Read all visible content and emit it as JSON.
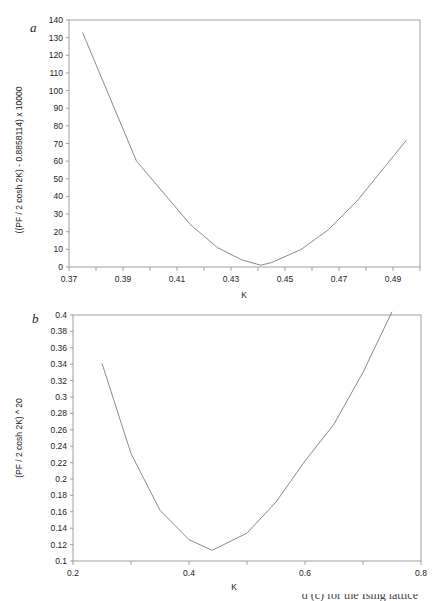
{
  "chart_data": [
    {
      "panel": "a",
      "type": "line",
      "title": "",
      "xlabel": "K",
      "ylabel": "((PF / 2 cosh 2K) - 0.8858114) x 10000",
      "xlim": [
        0.37,
        0.5
      ],
      "ylim": [
        0,
        140
      ],
      "xticks": [
        "0.37",
        "0.39",
        "0.41",
        "0.43",
        "0.45",
        "0.47",
        "0.49"
      ],
      "yticks": [
        "0",
        "10",
        "20",
        "30",
        "40",
        "50",
        "60",
        "70",
        "80",
        "90",
        "100",
        "110",
        "120",
        "130",
        "140"
      ],
      "grid": false,
      "legend": null,
      "x": [
        0.375,
        0.395,
        0.415,
        0.425,
        0.434,
        0.441,
        0.445,
        0.456,
        0.466,
        0.477,
        0.495
      ],
      "y": [
        133,
        60,
        24,
        11,
        4,
        1,
        2.5,
        10,
        21,
        38,
        72
      ]
    },
    {
      "panel": "b",
      "type": "line",
      "title": "",
      "xlabel": "K",
      "ylabel": "(PF / 2 cosh 2K) ^ 20",
      "xlim": [
        0.2,
        0.8
      ],
      "ylim": [
        0.1,
        0.4
      ],
      "xticks": [
        "0.2",
        "0.4",
        "0.6",
        "0.8"
      ],
      "yticks": [
        "0.1",
        "0.12",
        "0.14",
        "0.16",
        "0.18",
        "0.2",
        "0.22",
        "0.24",
        "0.26",
        "0.28",
        "0.3",
        "0.32",
        "0.34",
        "0.36",
        "0.38",
        "0.4"
      ],
      "grid": false,
      "legend": null,
      "x": [
        0.25,
        0.3,
        0.35,
        0.4,
        0.44,
        0.5,
        0.55,
        0.6,
        0.65,
        0.7,
        0.75
      ],
      "y": [
        0.341,
        0.231,
        0.162,
        0.126,
        0.113,
        0.134,
        0.172,
        0.222,
        0.267,
        0.33,
        0.404
      ]
    }
  ],
  "panels": {
    "a": {
      "letter": "a",
      "xlabel": "K",
      "ylabel": "((PF / 2 cosh 2K) - 0.8858114) x 10000"
    },
    "b": {
      "letter": "b",
      "xlabel": "K",
      "ylabel": "(PF / 2 cosh 2K) ^ 20"
    }
  },
  "caption": "d (c) for the Ising lattice",
  "colors": {
    "axis": "#888888",
    "line": "#8a8a8a",
    "text": "#222222"
  }
}
